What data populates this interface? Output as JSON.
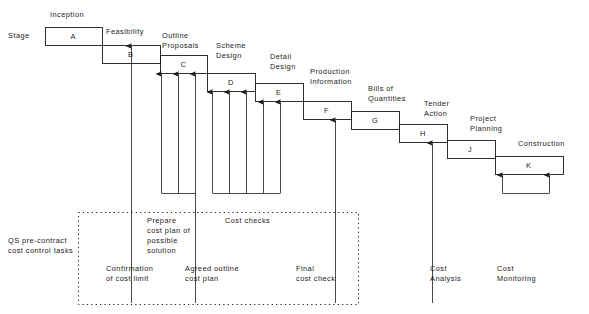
{
  "diagram": {
    "row_label": "Stage",
    "stages": [
      {
        "key": "A",
        "letter": "A",
        "name": "Inception",
        "x": 45,
        "y": 27,
        "w": 57,
        "h": 18,
        "label_x": 50,
        "label_y": 10,
        "lines": [
          "Inception"
        ]
      },
      {
        "key": "B",
        "letter": "B",
        "name": "Feasibility",
        "x": 102,
        "y": 45,
        "w": 58,
        "h": 18,
        "label_x": 106,
        "label_y": 27,
        "lines": [
          "Feasibility"
        ]
      },
      {
        "key": "C",
        "letter": "C",
        "name": "Outline Proposals",
        "x": 160,
        "y": 55,
        "w": 47,
        "h": 18,
        "label_x": 162,
        "label_y": 31,
        "lines": [
          "Outline",
          "Proposals"
        ]
      },
      {
        "key": "D",
        "letter": "D",
        "name": "Scheme Design",
        "x": 207,
        "y": 73,
        "w": 48,
        "h": 18,
        "label_x": 216,
        "label_y": 41,
        "lines": [
          "Scheme",
          "Design"
        ]
      },
      {
        "key": "E",
        "letter": "E",
        "name": "Detail Design",
        "x": 255,
        "y": 83,
        "w": 48,
        "h": 18,
        "label_x": 270,
        "label_y": 52,
        "lines": [
          "Detail",
          "Design"
        ]
      },
      {
        "key": "F",
        "letter": "F",
        "name": "Production Information",
        "x": 303,
        "y": 101,
        "w": 48,
        "h": 18,
        "label_x": 310,
        "label_y": 67,
        "lines": [
          "Production",
          "Information"
        ]
      },
      {
        "key": "G",
        "letter": "G",
        "name": "Bills of Quantities",
        "x": 351,
        "y": 111,
        "w": 48,
        "h": 18,
        "label_x": 368,
        "label_y": 84,
        "lines": [
          "Bills  of",
          "Quantities"
        ]
      },
      {
        "key": "H",
        "letter": "H",
        "name": "Tender Action",
        "x": 399,
        "y": 124,
        "w": 48,
        "h": 18,
        "label_x": 424,
        "label_y": 99,
        "lines": [
          "Tender",
          "Action"
        ]
      },
      {
        "key": "J",
        "letter": "J",
        "name": "Project Planning",
        "x": 447,
        "y": 140,
        "w": 48,
        "h": 18,
        "label_x": 470,
        "label_y": 114,
        "lines": [
          "Project",
          "Planning"
        ]
      },
      {
        "key": "K",
        "letter": "K",
        "name": "Construction",
        "x": 495,
        "y": 156,
        "w": 68,
        "h": 18,
        "label_x": 518,
        "label_y": 139,
        "lines": [
          "Construction"
        ]
      }
    ],
    "group_label": {
      "lines": [
        "QS pre-contract",
        "cost control tasks"
      ],
      "x": 8,
      "y": 236
    },
    "panel": {
      "x": 78,
      "y": 212,
      "w": 280,
      "h": 92
    },
    "task_labels": [
      {
        "name": "prepare-cost-plan",
        "lines": [
          "Prepare",
          "cost  plan of",
          "possible",
          "solution"
        ],
        "x": 147,
        "y": 216
      },
      {
        "name": "cost-checks",
        "lines": [
          "Cost  checks"
        ],
        "x": 225,
        "y": 216
      },
      {
        "name": "confirmation-of-cost-limit",
        "lines": [
          "Confirmation",
          "of  cost  limit"
        ],
        "x": 106,
        "y": 264
      },
      {
        "name": "agreed-outline-cost-plan",
        "lines": [
          "Agreed  outline",
          "cost  plan"
        ],
        "x": 185,
        "y": 264
      },
      {
        "name": "final-cost-check",
        "lines": [
          "Final",
          "cost check"
        ],
        "x": 296,
        "y": 264
      },
      {
        "name": "cost-analysis",
        "lines": [
          "Cost",
          "Analysis"
        ],
        "x": 430,
        "y": 264
      },
      {
        "name": "cost-monitoring",
        "lines": [
          "Cost",
          "Monitoring"
        ],
        "x": 497,
        "y": 264
      }
    ],
    "connectors": {
      "description": "Vertical arrows rising from the task bracket lines up to the underside of the stage boxes",
      "arrows": [
        {
          "x": 131,
          "top": 46,
          "bottom": 303
        },
        {
          "x": 161,
          "top": 74,
          "bottom": 193
        },
        {
          "x": 178,
          "top": 74,
          "bottom": 193
        },
        {
          "x": 195,
          "top": 74,
          "bottom": 303
        },
        {
          "x": 212,
          "top": 92,
          "bottom": 193
        },
        {
          "x": 229,
          "top": 92,
          "bottom": 193
        },
        {
          "x": 246,
          "top": 92,
          "bottom": 193
        },
        {
          "x": 263,
          "top": 102,
          "bottom": 193
        },
        {
          "x": 280,
          "top": 102,
          "bottom": 193
        },
        {
          "x": 335,
          "top": 120,
          "bottom": 303
        },
        {
          "x": 432,
          "top": 143,
          "bottom": 303
        },
        {
          "x": 502,
          "top": 175,
          "bottom": 193
        },
        {
          "x": 549,
          "top": 175,
          "bottom": 193
        }
      ],
      "brackets": [
        {
          "name": "prepare-cost-plan-bracket",
          "x1": 161,
          "x2": 195,
          "y": 193
        },
        {
          "name": "cost-checks-bracket",
          "x1": 212,
          "x2": 280,
          "y": 193
        },
        {
          "name": "cost-monitoring-bracket",
          "x1": 502,
          "x2": 549,
          "y": 193
        }
      ]
    },
    "colors": {
      "ink": "#1a1a1a",
      "background": "#ffffff"
    }
  }
}
